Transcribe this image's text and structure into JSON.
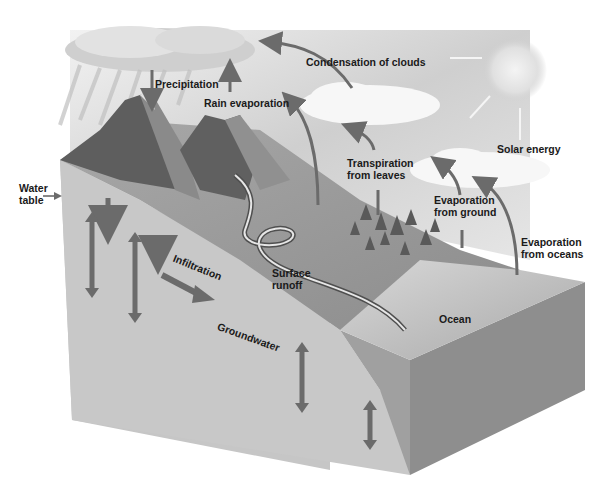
{
  "diagram": {
    "labels": {
      "precipitation": "Precipitation",
      "rain_evaporation": "Rain evaporation",
      "condensation": "Condensation of clouds",
      "solar_energy": "Solar energy",
      "transpiration_1": "Transpiration",
      "transpiration_2": "from leaves",
      "evap_ground_1": "Evaporation",
      "evap_ground_2": "from ground",
      "evap_oceans_1": "Evaporation",
      "evap_oceans_2": "from oceans",
      "water_table_1": "Water",
      "water_table_2": "table",
      "infiltration": "Infiltration",
      "surface_runoff_1": "Surface",
      "surface_runoff_2": "runoff",
      "groundwater": "Groundwater",
      "ocean": "Ocean"
    },
    "colors": {
      "arrow": "#6b6b6b",
      "sky": "#d9d9d9",
      "ground_cut": "#c4c4c4",
      "ocean_side": "#8a8a8a",
      "terrain": "#9a9a9a",
      "mountain": "#5a5a5a"
    }
  }
}
